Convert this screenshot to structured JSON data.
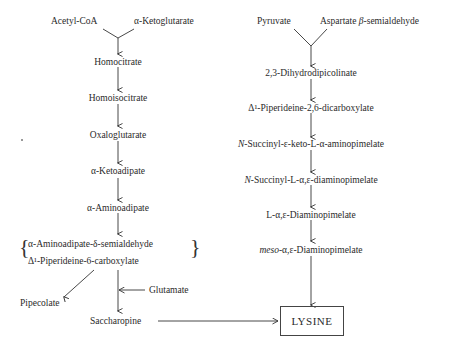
{
  "diagram": {
    "title": "",
    "left_pathway": {
      "inputs": [
        "Acetyl-CoA",
        "α-Ketoglutarate"
      ],
      "steps": [
        "Homocitrate",
        "Homoisocitrate",
        "Oxaloglutarate",
        "α-Ketoadipate",
        "α-Aminoadipate"
      ],
      "bracket_group": [
        "α-Aminoadipate-δ-semialdehyde",
        "Δ¹-Piperideine-6-carboxylate"
      ],
      "side_product": "Pipecolate",
      "cofactor": "Glutamate",
      "final_intermediate": "Saccharopine"
    },
    "right_pathway": {
      "inputs": [
        "Pyruvate",
        "Aspartate β-semialdehyde"
      ],
      "input_prefix_aspartate": "Aspartate ",
      "input_beta": "β",
      "input_suffix_aspartate": "-semialdehyde",
      "steps": [
        "2,3-Dihydrodipicolinate",
        "Δ¹-Piperideine-2,6-dicarboxylate",
        "N-Succinyl-ε-keto-L-α-aminopimelate",
        "N-Succinyl-L-α,ε-diaminopimelate",
        "L-α,ε-Diaminopimelate",
        "meso-α,ε-Diaminopimelate"
      ],
      "step_parts": {
        "succ1_italic": "N",
        "succ1_rest": "-Succinyl-ε-keto-L-α-aminopimelate",
        "succ2_italic": "N",
        "succ2_rest": "-Succinyl-L-α,ε-diaminopimelate",
        "meso_italic": "meso",
        "meso_rest": "-α,ε-Diaminopimelate"
      }
    },
    "product": "LYSINE",
    "colors": {
      "line": "#333333",
      "text": "#2a2a2a",
      "background": "#ffffff"
    }
  }
}
